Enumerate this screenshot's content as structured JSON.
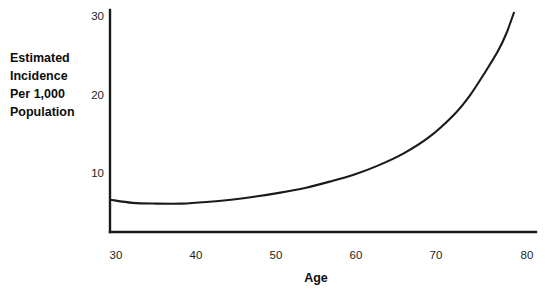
{
  "chart_data": {
    "type": "line",
    "title": "",
    "xlabel": "Age",
    "ylabel": "Estimated Incidence Per 1,000 Population",
    "ylabel_lines": [
      "Estimated",
      "Incidence",
      "Per 1,000",
      "Population"
    ],
    "xlim": [
      28.5,
      81.0
    ],
    "ylim": [
      2.5,
      31.0
    ],
    "xticks": [
      30,
      40,
      50,
      60,
      70,
      80
    ],
    "xtick_labels": [
      "30",
      "40",
      "50",
      "60",
      "70",
      "80"
    ],
    "yticks": [
      10,
      20,
      30
    ],
    "ytick_labels": [
      "10",
      "20",
      "30"
    ],
    "grid": false,
    "legend": false,
    "series": [
      {
        "name": "Estimated incidence per 1,000 population",
        "x": [
          29.3,
          32.0,
          35.0,
          38.0,
          41.0,
          44.0,
          47.0,
          50.0,
          53.0,
          56.0,
          59.0,
          62.0,
          65.0,
          68.0,
          71.0,
          73.0,
          75.0,
          76.5,
          77.5,
          78.4
        ],
        "y": [
          6.6,
          6.2,
          6.1,
          6.1,
          6.3,
          6.6,
          7.0,
          7.5,
          8.1,
          8.9,
          9.8,
          11.0,
          12.5,
          14.5,
          17.3,
          19.8,
          23.0,
          25.6,
          27.8,
          30.4
        ]
      }
    ],
    "colors": {
      "curve": "#1a1a1a",
      "axis": "#1a1a1a",
      "tick_text": "#231f20",
      "title_text": "#0d0d0d",
      "background": "#ffffff"
    }
  },
  "geometry": {
    "plot_left": 110,
    "plot_right": 536,
    "plot_top": 10,
    "plot_bottom": 232,
    "x_px": {
      "30": 116,
      "40": 196,
      "50": 276,
      "60": 356,
      "70": 436,
      "80": 527
    },
    "y_px": {
      "10": 173,
      "20": 95,
      "30": 16
    },
    "ylabel_x": 10,
    "ylabel_first_baseline": 62,
    "ylabel_line_height": 18,
    "xlabel_x": 316,
    "xlabel_baseline": 282
  }
}
